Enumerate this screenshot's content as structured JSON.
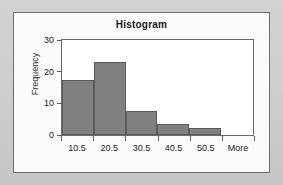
{
  "chart_data": {
    "type": "bar",
    "title": "Histogram",
    "xlabel": "",
    "ylabel": "Frequency",
    "categories": [
      "10.5",
      "20.5",
      "30.5",
      "40.5",
      "50.5",
      "More"
    ],
    "values": [
      19,
      25.5,
      8.5,
      4,
      2.5,
      0
    ],
    "ylim": [
      0,
      33
    ],
    "yticks": [
      0,
      10,
      20,
      30
    ],
    "ytick_labels": [
      "0",
      "10",
      "20",
      "30"
    ],
    "grid": false,
    "legend": null,
    "bar_color": "#808080",
    "bar_border_color": "#5a5a5a",
    "plot_background": "#ffffff",
    "frame_background": "#fbfbfb",
    "page_background": "#cfcfcf",
    "text_color": "#222222"
  }
}
